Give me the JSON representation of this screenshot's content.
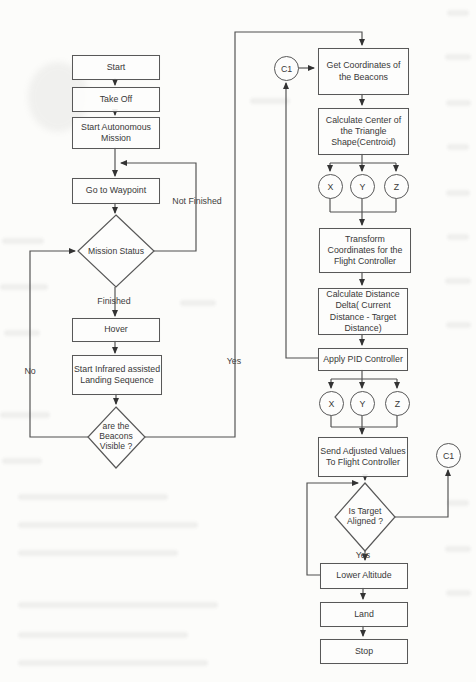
{
  "nodes": {
    "start": {
      "label": "Start"
    },
    "take_off": {
      "label": "Take Off"
    },
    "start_autonomous_mission": {
      "label": "Start Autonomous\nMission"
    },
    "go_to_waypoint": {
      "label": "Go to Waypoint"
    },
    "mission_status": {
      "label": "Mission Status"
    },
    "hover": {
      "label": "Hover"
    },
    "start_infrared": {
      "label": "Start Infrared assisted\nLanding Sequence"
    },
    "beacons_visible": {
      "label": "are the\nBeacons\nVisible ?"
    },
    "get_coordinates": {
      "label": "Get Coordinates of\nthe Beacons"
    },
    "calculate_center": {
      "label": "Calculate Center of\nthe Triangle\nShape(Centroid)"
    },
    "transform_coordinates": {
      "label": "Transform\nCoordinates for the\nFlight Controller"
    },
    "calculate_distance": {
      "label": "Calculate Distance\nDelta( Current\nDistance - Target\nDistance)"
    },
    "apply_pid": {
      "label": "Apply PID Controller"
    },
    "send_adjusted": {
      "label": "Send Adjusted Values\nTo Flight Controller"
    },
    "is_target_aligned": {
      "label": "Is Target\nAligned ?"
    },
    "lower_altitude": {
      "label": "Lower Altitude"
    },
    "land": {
      "label": "Land"
    },
    "stop": {
      "label": "Stop"
    }
  },
  "connectors": {
    "c1_top": "C1",
    "c1_right": "C1",
    "axes_top": [
      "X",
      "Y",
      "Z"
    ],
    "axes_bottom": [
      "X",
      "Y",
      "Z"
    ]
  },
  "edge_labels": {
    "not_finished": "Not Finished",
    "finished": "Finished",
    "no": "No",
    "yes_beacons": "Yes",
    "yes_aligned": "Yes"
  },
  "colors": {
    "line": "#4f4f4f",
    "box_border": "#585858",
    "text": "#383838",
    "background": "#fcfcfa"
  }
}
